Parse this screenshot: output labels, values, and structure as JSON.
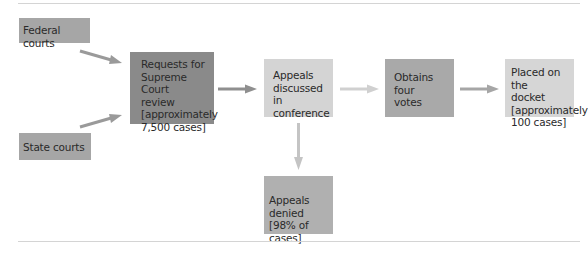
{
  "diagram": {
    "type": "flowchart",
    "nodes": [
      {
        "id": "federal",
        "label": "Federal courts",
        "color": "#a6a6a6"
      },
      {
        "id": "state",
        "label": "State courts",
        "color": "#a6a6a6"
      },
      {
        "id": "requests",
        "label": "Requests for\nSupreme Court\nreview\n[approximately\n7,500 cases]",
        "color": "#8a8a8a"
      },
      {
        "id": "discussed",
        "label": "Appeals\ndiscussed in\nconference",
        "color": "#d4d4d4"
      },
      {
        "id": "obtains",
        "label": "Obtains four\nvotes",
        "color": "#a9a9a9"
      },
      {
        "id": "placed",
        "label": "Placed on the\ndocket\n[approximately\n100 cases]",
        "color": "#d6d6d6"
      },
      {
        "id": "denied",
        "label": "Appeals denied\n[98% of cases]",
        "color": "#b0b0b0"
      }
    ],
    "edges": [
      {
        "from": "federal",
        "to": "requests",
        "color": "#9a9a9a"
      },
      {
        "from": "state",
        "to": "requests",
        "color": "#9a9a9a"
      },
      {
        "from": "requests",
        "to": "discussed",
        "color": "#8f8f8f"
      },
      {
        "from": "discussed",
        "to": "obtains",
        "color": "#d0d0d0"
      },
      {
        "from": "obtains",
        "to": "placed",
        "color": "#a6a6a6"
      },
      {
        "from": "discussed",
        "to": "denied",
        "color": "#c4c4c4"
      }
    ]
  }
}
